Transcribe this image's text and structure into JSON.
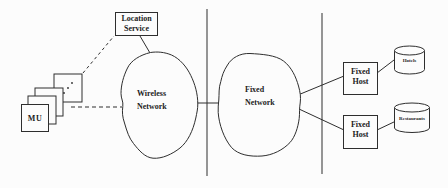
{
  "figure": {
    "colors": {
      "background": "#fcfcfc",
      "line": "#2e2e2e",
      "text": "#1c1c1c"
    },
    "location_service": {
      "line1": "Location",
      "line2": "Service"
    },
    "mu_stack": {
      "front_label": "MU"
    },
    "wireless_network": {
      "line1": "Wireless",
      "line2": "Network"
    },
    "fixed_network": {
      "line1": "Fixed",
      "line2": "Network"
    },
    "fixed_hosts": {
      "top": {
        "line1": "Fixed",
        "line2": "Host"
      },
      "bottom": {
        "line1": "Fixed",
        "line2": "Host"
      }
    },
    "databases": {
      "top": {
        "label": "Hotels"
      },
      "bottom": {
        "label": "Restaurants"
      }
    }
  }
}
